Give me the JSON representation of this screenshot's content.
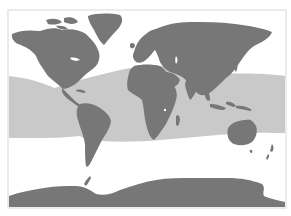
{
  "map": {
    "type": "world-distribution-map",
    "projection": "miller-cylindrical",
    "colors": {
      "background": "#ffffff",
      "frame": "#d8d8d8",
      "ocean": "#ffffff",
      "land": "#777777",
      "range": "#c9c9c9"
    },
    "frame": {
      "x": 8,
      "y": 10,
      "width": 278,
      "height": 198
    },
    "layers": [
      {
        "name": "distribution-range",
        "description": "light gray band over tropical and subtropical oceans"
      },
      {
        "name": "landmasses",
        "description": "all continents in dark gray"
      }
    ],
    "regions": [
      "North America",
      "Greenland",
      "South America",
      "Europe",
      "Africa",
      "Asia",
      "Australia",
      "New Zealand",
      "Antarctica",
      "Indonesia",
      "Japan"
    ]
  }
}
